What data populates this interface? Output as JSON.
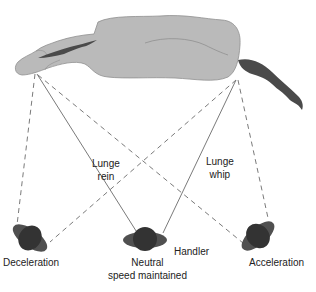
{
  "diagram": {
    "labels": {
      "lunge_rein": "Lunge\nrein",
      "lunge_whip": "Lunge\nwhip",
      "handler": "Handler",
      "deceleration": "Deceleration",
      "neutral": "Neutral\nspeed maintained",
      "acceleration": "Acceleration"
    },
    "lines": [
      {
        "from": "horse-head",
        "to": "handler-deceleration",
        "style": "dashed"
      },
      {
        "from": "horse-head",
        "to": "handler-acceleration",
        "style": "dashed"
      },
      {
        "from": "horse-head",
        "to": "handler-neutral",
        "style": "solid",
        "label": "Lunge rein"
      },
      {
        "from": "horse-tail",
        "to": "handler-deceleration",
        "style": "dashed"
      },
      {
        "from": "horse-tail",
        "to": "handler-neutral",
        "style": "solid",
        "label": "Lunge whip"
      },
      {
        "from": "horse-tail",
        "to": "handler-acceleration",
        "style": "dashed"
      }
    ],
    "colors": {
      "horse_body": "#b9b9b9",
      "mane_tail": "#4a4a4a",
      "handler": "#3c3c3c",
      "line": "#777777"
    }
  }
}
